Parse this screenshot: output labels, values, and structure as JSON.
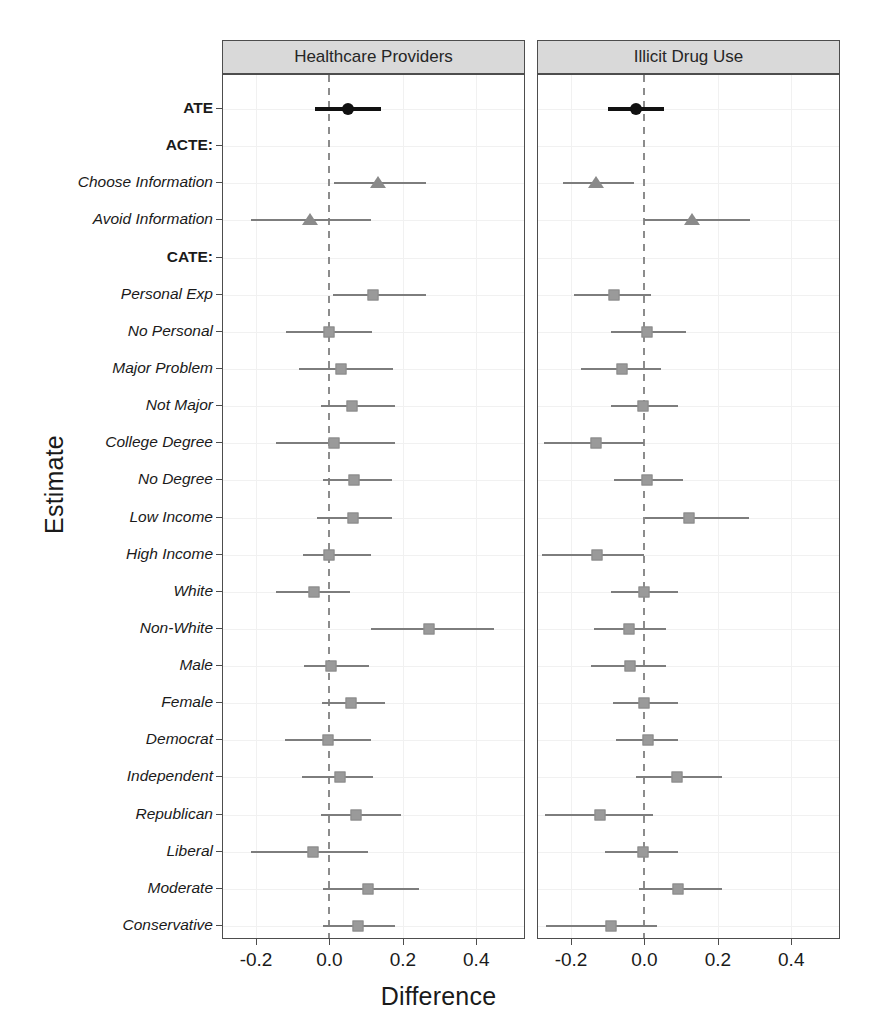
{
  "chart_data": {
    "type": "scatter",
    "title": "",
    "xlabel": "Difference",
    "ylabel": "Estimate",
    "xlim": [
      -0.29,
      0.53
    ],
    "xticks": [
      -0.2,
      0.0,
      0.2,
      0.4
    ],
    "xticklabels": [
      "-0.2",
      "0.0",
      "0.2",
      "0.4"
    ],
    "grid": true,
    "legend": "none",
    "reference_line": 0.0,
    "panels": [
      {
        "label": "Healthcare Providers"
      },
      {
        "label": "Illicit Drug Use"
      }
    ],
    "categories": [
      "ATE",
      "ACTE:",
      "Choose Information",
      "Avoid Information",
      "CATE:",
      "Personal Exp",
      "No Personal",
      "Major Problem",
      "Not Major",
      "College Degree",
      "No Degree",
      "Low Income",
      "High Income",
      "White",
      "Non-White",
      "Male",
      "Female",
      "Democrat",
      "Independent",
      "Republican",
      "Liberal",
      "Moderate",
      "Conservative"
    ],
    "category_styles": [
      "bold",
      "bold",
      "italic",
      "italic",
      "bold",
      "italic",
      "italic",
      "italic",
      "italic",
      "italic",
      "italic",
      "italic",
      "italic",
      "italic",
      "italic",
      "italic",
      "italic",
      "italic",
      "italic",
      "italic",
      "italic",
      "italic",
      "italic"
    ],
    "marker_styles": [
      "circle",
      "none",
      "triangle",
      "triangle",
      "none",
      "square",
      "square",
      "square",
      "square",
      "square",
      "square",
      "square",
      "square",
      "square",
      "square",
      "square",
      "square",
      "square",
      "square",
      "square",
      "square",
      "square",
      "square"
    ],
    "series": [
      {
        "name": "Healthcare Providers",
        "panel": 0,
        "points": [
          {
            "category": "ATE",
            "estimate": 0.05,
            "lo": -0.04,
            "hi": 0.14
          },
          {
            "category": "ACTE:",
            "estimate": null,
            "lo": null,
            "hi": null
          },
          {
            "category": "Choose Information",
            "estimate": 0.132,
            "lo": 0.013,
            "hi": 0.262
          },
          {
            "category": "Avoid Information",
            "estimate": -0.053,
            "lo": -0.213,
            "hi": 0.112
          },
          {
            "category": "CATE:",
            "estimate": null,
            "lo": null,
            "hi": null
          },
          {
            "category": "Personal Exp",
            "estimate": 0.118,
            "lo": 0.01,
            "hi": 0.262
          },
          {
            "category": "No Personal",
            "estimate": -0.002,
            "lo": -0.118,
            "hi": 0.115
          },
          {
            "category": "Major Problem",
            "estimate": 0.032,
            "lo": -0.082,
            "hi": 0.172
          },
          {
            "category": "Not Major",
            "estimate": 0.062,
            "lo": -0.022,
            "hi": 0.178
          },
          {
            "category": "College Degree",
            "estimate": 0.012,
            "lo": -0.145,
            "hi": 0.178
          },
          {
            "category": "No Degree",
            "estimate": 0.068,
            "lo": -0.018,
            "hi": 0.17
          },
          {
            "category": "Low Income",
            "estimate": 0.065,
            "lo": -0.035,
            "hi": 0.17
          },
          {
            "category": "High Income",
            "estimate": -0.002,
            "lo": -0.072,
            "hi": 0.112
          },
          {
            "category": "White",
            "estimate": -0.043,
            "lo": -0.145,
            "hi": 0.055
          },
          {
            "category": "Non-White",
            "estimate": 0.272,
            "lo": 0.112,
            "hi": 0.448
          },
          {
            "category": "Male",
            "estimate": 0.005,
            "lo": -0.07,
            "hi": 0.108
          },
          {
            "category": "Female",
            "estimate": 0.058,
            "lo": -0.02,
            "hi": 0.152
          },
          {
            "category": "Democrat",
            "estimate": -0.005,
            "lo": -0.12,
            "hi": 0.112
          },
          {
            "category": "Independent",
            "estimate": 0.03,
            "lo": -0.075,
            "hi": 0.118
          },
          {
            "category": "Republican",
            "estimate": 0.072,
            "lo": -0.022,
            "hi": 0.195
          },
          {
            "category": "Liberal",
            "estimate": -0.045,
            "lo": -0.215,
            "hi": 0.105
          },
          {
            "category": "Moderate",
            "estimate": 0.105,
            "lo": -0.018,
            "hi": 0.245
          },
          {
            "category": "Conservative",
            "estimate": 0.078,
            "lo": -0.018,
            "hi": 0.178
          }
        ]
      },
      {
        "name": "Illicit Drug Use",
        "panel": 1,
        "points": [
          {
            "category": "ATE",
            "estimate": -0.022,
            "lo": -0.098,
            "hi": 0.052
          },
          {
            "category": "ACTE:",
            "estimate": null,
            "lo": null,
            "hi": null
          },
          {
            "category": "Choose Information",
            "estimate": -0.132,
            "lo": -0.222,
            "hi": -0.028
          },
          {
            "category": "Avoid Information",
            "estimate": 0.13,
            "lo": 0.0,
            "hi": 0.288
          },
          {
            "category": "CATE:",
            "estimate": null,
            "lo": null,
            "hi": null
          },
          {
            "category": "Personal Exp",
            "estimate": -0.082,
            "lo": -0.192,
            "hi": 0.018
          },
          {
            "category": "No Personal",
            "estimate": 0.008,
            "lo": -0.092,
            "hi": 0.112
          },
          {
            "category": "Major Problem",
            "estimate": -0.06,
            "lo": -0.172,
            "hi": 0.045
          },
          {
            "category": "Not Major",
            "estimate": -0.005,
            "lo": -0.092,
            "hi": 0.092
          },
          {
            "category": "College Degree",
            "estimate": -0.132,
            "lo": -0.275,
            "hi": 0.0
          },
          {
            "category": "No Degree",
            "estimate": 0.008,
            "lo": -0.082,
            "hi": 0.105
          },
          {
            "category": "Low Income",
            "estimate": 0.12,
            "lo": 0.002,
            "hi": 0.285
          },
          {
            "category": "High Income",
            "estimate": -0.13,
            "lo": -0.278,
            "hi": 0.0
          },
          {
            "category": "White",
            "estimate": 0.0,
            "lo": -0.092,
            "hi": 0.092
          },
          {
            "category": "Non-White",
            "estimate": -0.042,
            "lo": -0.138,
            "hi": 0.058
          },
          {
            "category": "Male",
            "estimate": -0.04,
            "lo": -0.145,
            "hi": 0.058
          },
          {
            "category": "Female",
            "estimate": -0.002,
            "lo": -0.085,
            "hi": 0.092
          },
          {
            "category": "Democrat",
            "estimate": 0.01,
            "lo": -0.078,
            "hi": 0.092
          },
          {
            "category": "Independent",
            "estimate": 0.088,
            "lo": -0.022,
            "hi": 0.212
          },
          {
            "category": "Republican",
            "estimate": -0.122,
            "lo": -0.272,
            "hi": 0.022
          },
          {
            "category": "Liberal",
            "estimate": -0.005,
            "lo": -0.108,
            "hi": 0.092
          },
          {
            "category": "Moderate",
            "estimate": 0.092,
            "lo": -0.015,
            "hi": 0.212
          },
          {
            "category": "Conservative",
            "estimate": -0.09,
            "lo": -0.268,
            "hi": 0.035
          }
        ]
      }
    ]
  },
  "colors": {
    "ate": "#111111",
    "acte": "#8a8a8a",
    "cate": "#9a9a9a",
    "strip_bg": "#d9d9d9",
    "panel_border": "#4d4d4d",
    "grid": "#f1f1f1",
    "zeroline": "#8c8c8c"
  }
}
